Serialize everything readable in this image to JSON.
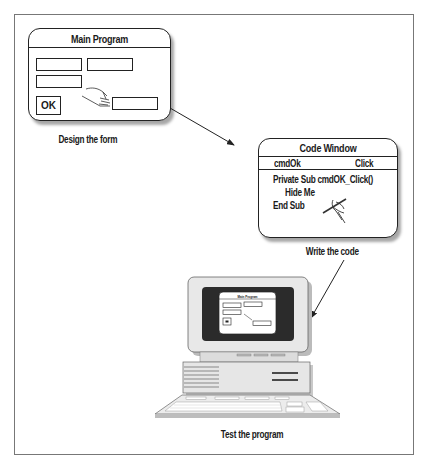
{
  "diagram": {
    "steps": [
      {
        "id": "design",
        "caption": "Design the form",
        "window": {
          "title": "Main Program",
          "ok_button_label": "OK",
          "text_boxes": 4,
          "icon": "hand-pointer-icon"
        }
      },
      {
        "id": "code",
        "caption": "Write the code",
        "window": {
          "title": "Code Window",
          "object_label": "cmdOk",
          "event_label": "Click",
          "code_lines": [
            "Private Sub cmdOK_Click()",
            "Hide Me",
            "End Sub"
          ],
          "icon": "hand-writing-pen-icon"
        }
      },
      {
        "id": "test",
        "caption": "Test the program",
        "illustration": "desktop-computer-icon",
        "screen_window_title": "Main Program"
      }
    ],
    "arrows": [
      {
        "from": "design",
        "to": "code"
      },
      {
        "from": "code",
        "to": "test"
      }
    ],
    "colors": {
      "line": "#222222",
      "frame": "#777777",
      "screen": "#2b2b2b",
      "computer_body": "#e6e6e6"
    }
  }
}
